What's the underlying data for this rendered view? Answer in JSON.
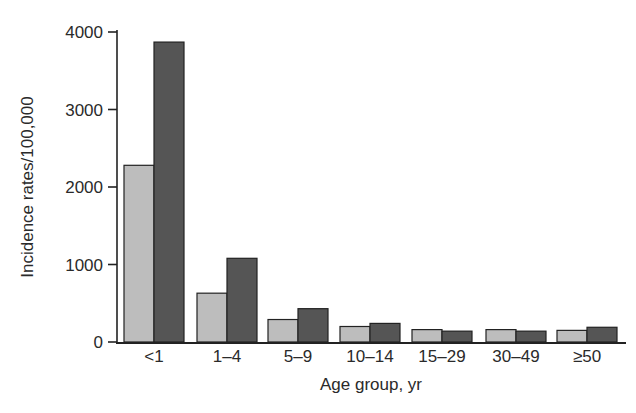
{
  "chart_data": {
    "type": "bar",
    "title": "",
    "xlabel": "Age group, yr",
    "ylabel": "Incidence rates/100,000",
    "ylim": [
      0,
      4000
    ],
    "yticks": [
      0,
      1000,
      2000,
      3000,
      4000
    ],
    "grid": false,
    "legend": null,
    "categories": [
      "<1",
      "1–4",
      "5–9",
      "10–14",
      "15–29",
      "30–49",
      "≥50"
    ],
    "series": [
      {
        "name": "Series 1 (light gray)",
        "color": "#bdbdbd",
        "values": [
          2280,
          630,
          290,
          200,
          160,
          160,
          150
        ]
      },
      {
        "name": "Series 2 (dark gray)",
        "color": "#555555",
        "values": [
          3870,
          1080,
          430,
          240,
          140,
          140,
          190
        ]
      }
    ]
  }
}
